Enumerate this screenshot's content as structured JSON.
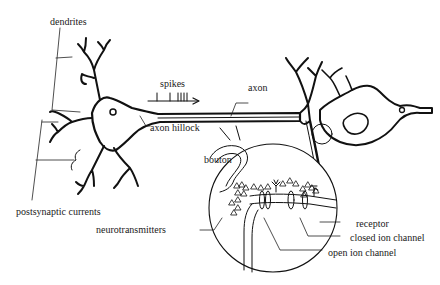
{
  "diagram": {
    "labels": {
      "dendrites": "dendrites",
      "spikes": "spikes",
      "axon": "axon",
      "axon_hillock": "axon hillock",
      "postsynaptic_currents": "postsynaptic currents",
      "bouton": "bouton",
      "neurotransmitters": "neurotransmitters",
      "receptor": "receptor",
      "closed_ion_channel": "closed ion channel",
      "open_ion_channel": "open ion channel"
    },
    "colors": {
      "ink": "#111111",
      "background": "#ffffff"
    }
  }
}
